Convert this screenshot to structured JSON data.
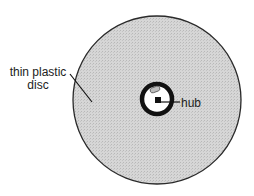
{
  "diagram": {
    "labels": {
      "disc_line1": "thin plastic",
      "disc_line2": "disc",
      "hub": "hub"
    },
    "colors": {
      "disc_fill": "#cfcfcf",
      "outline": "#2a2a2a",
      "hub_ring": "#111111",
      "hub_center": "#ffffff",
      "background": "#ffffff"
    }
  }
}
